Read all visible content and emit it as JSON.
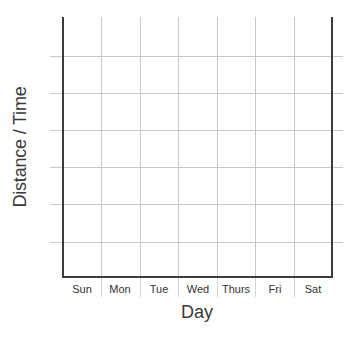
{
  "chart_data": {
    "type": "line",
    "title": "",
    "xlabel": "Day",
    "ylabel": "Distance / Time",
    "categories": [
      "Sun",
      "Mon",
      "Tue",
      "Wed",
      "Thurs",
      "Fri",
      "Sat"
    ],
    "series": [],
    "y_gridlines": 6,
    "grid": true,
    "legend": null,
    "note": "Blank template grid; no data plotted"
  },
  "axes": {
    "x_label": "Day",
    "y_label": "Distance / Time",
    "x_ticks": [
      "Sun",
      "Mon",
      "Tue",
      "Wed",
      "Thurs",
      "Fri",
      "Sat"
    ]
  },
  "colors": {
    "axis": "#3c3c3c",
    "grid": "#c8c8c8",
    "text": "#333333"
  }
}
